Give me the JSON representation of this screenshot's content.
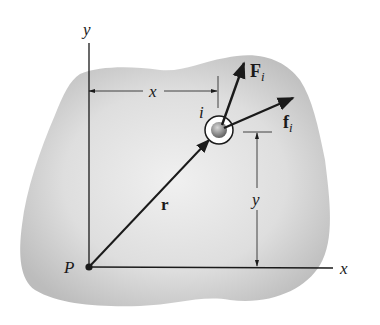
{
  "figure": {
    "colors": {
      "body_fill_light": "#ececec",
      "body_fill_dark": "#b8b8b8",
      "line": "#1a1a1a",
      "particle": "#8a8a8a",
      "background": "#ffffff"
    },
    "labels": {
      "y_axis": "y",
      "x_axis": "x",
      "origin": "P",
      "position_vector": "r",
      "particle": "i",
      "external_force": "F",
      "external_force_sub": "i",
      "internal_force": "f",
      "internal_force_sub": "i",
      "x_dimension": "x",
      "y_dimension": "y"
    }
  }
}
